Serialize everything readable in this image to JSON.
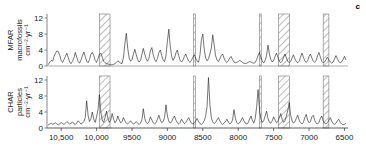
{
  "panel_label": "c",
  "xaxis_title": "Years before present",
  "chart_data": {
    "type": "line",
    "title": "",
    "subtitle": "",
    "panel_label": "c",
    "xlabel": "Years before present",
    "xlim": [
      10700,
      6450
    ],
    "x_reversed": true,
    "xticks": [
      10500,
      10000,
      9500,
      9000,
      8500,
      8000,
      7500,
      7000,
      6500
    ],
    "xticklabels": [
      "10,500",
      "10,000",
      "9500",
      "9000",
      "8500",
      "8000",
      "7500",
      "7000",
      "6500"
    ],
    "grid": false,
    "legend": "none",
    "line_color": "#1a1a1a",
    "band_color": "#555555",
    "panels": [
      {
        "name": "MFAR",
        "ylabel_line1": "MFAR",
        "ylabel_line2": "macrofossils",
        "ylabel_line3": "cm⁻²·yr⁻¹",
        "ylim": [
          0,
          13
        ],
        "yticks": [
          0,
          4,
          8,
          12
        ],
        "yticklabels": [
          "0",
          "4",
          "8",
          "12"
        ],
        "x": [
          10680,
          10660,
          10640,
          10620,
          10600,
          10580,
          10560,
          10540,
          10520,
          10500,
          10480,
          10460,
          10440,
          10420,
          10400,
          10380,
          10360,
          10340,
          10320,
          10300,
          10280,
          10260,
          10240,
          10220,
          10200,
          10180,
          10160,
          10140,
          10120,
          10100,
          10080,
          10060,
          10040,
          10020,
          10000,
          9980,
          9960,
          9940,
          9920,
          9900,
          9880,
          9860,
          9840,
          9820,
          9800,
          9780,
          9760,
          9740,
          9720,
          9700,
          9680,
          9660,
          9640,
          9620,
          9600,
          9580,
          9560,
          9540,
          9520,
          9500,
          9480,
          9460,
          9440,
          9420,
          9400,
          9380,
          9360,
          9340,
          9320,
          9300,
          9280,
          9260,
          9240,
          9220,
          9200,
          9180,
          9160,
          9140,
          9120,
          9100,
          9080,
          9060,
          9040,
          9020,
          9000,
          8980,
          8960,
          8940,
          8920,
          8900,
          8880,
          8860,
          8840,
          8820,
          8800,
          8780,
          8760,
          8740,
          8720,
          8700,
          8680,
          8660,
          8640,
          8620,
          8600,
          8580,
          8560,
          8540,
          8520,
          8500,
          8480,
          8460,
          8440,
          8420,
          8400,
          8380,
          8360,
          8340,
          8320,
          8300,
          8280,
          8260,
          8240,
          8220,
          8200,
          8180,
          8160,
          8140,
          8120,
          8100,
          8080,
          8060,
          8040,
          8020,
          8000,
          7980,
          7960,
          7940,
          7920,
          7900,
          7880,
          7860,
          7840,
          7820,
          7800,
          7780,
          7760,
          7740,
          7720,
          7700,
          7680,
          7660,
          7640,
          7620,
          7600,
          7580,
          7560,
          7540,
          7520,
          7500,
          7480,
          7460,
          7440,
          7420,
          7400,
          7380,
          7360,
          7340,
          7320,
          7300,
          7280,
          7260,
          7240,
          7220,
          7200,
          7180,
          7160,
          7140,
          7120,
          7100,
          7080,
          7060,
          7040,
          7020,
          7000,
          6980,
          6960,
          6940,
          6920,
          6900,
          6880,
          6860,
          6840,
          6820,
          6800,
          6780,
          6760,
          6740,
          6720,
          6700,
          6680,
          6660,
          6640,
          6620,
          6600,
          6580,
          6560,
          6540,
          6520,
          6500,
          6480
        ],
        "y": [
          0.4,
          1.0,
          1.4,
          1.2,
          2.4,
          3.2,
          3.8,
          3.6,
          2.6,
          1.4,
          0.9,
          1.6,
          2.4,
          3.2,
          2.1,
          1.0,
          0.6,
          1.2,
          2.0,
          3.4,
          2.2,
          1.1,
          0.7,
          1.5,
          2.6,
          3.5,
          2.4,
          1.2,
          0.8,
          1.6,
          2.9,
          3.4,
          2.6,
          1.4,
          0.9,
          1.8,
          3.0,
          3.2,
          2.2,
          1.2,
          0.8,
          0.6,
          0.5,
          0.4,
          0.3,
          0.3,
          0.4,
          0.6,
          0.9,
          1.3,
          1.0,
          0.7,
          0.6,
          2.2,
          5.6,
          8.2,
          4.4,
          2.0,
          1.2,
          1.6,
          2.9,
          4.2,
          2.8,
          1.6,
          1.0,
          1.4,
          2.8,
          4.4,
          3.0,
          1.8,
          1.2,
          2.0,
          3.8,
          4.6,
          2.8,
          1.6,
          1.1,
          1.9,
          3.4,
          4.0,
          2.6,
          1.5,
          1.1,
          2.6,
          6.2,
          9.2,
          5.0,
          2.4,
          1.4,
          2.0,
          3.2,
          4.0,
          2.6,
          1.4,
          1.0,
          1.5,
          2.4,
          3.0,
          2.0,
          1.2,
          0.9,
          1.4,
          2.2,
          2.8,
          1.9,
          1.2,
          1.0,
          2.8,
          6.6,
          8.0,
          4.2,
          2.0,
          1.3,
          1.8,
          3.0,
          4.4,
          7.8,
          5.4,
          2.6,
          1.5,
          1.1,
          1.8,
          2.6,
          3.0,
          2.0,
          1.2,
          0.9,
          1.3,
          2.0,
          2.4,
          1.6,
          1.0,
          0.8,
          0.9,
          1.1,
          1.4,
          1.2,
          0.9,
          0.7,
          0.6,
          0.7,
          0.9,
          1.1,
          1.0,
          0.8,
          0.7,
          0.9,
          1.6,
          2.6,
          3.4,
          2.2,
          1.2,
          0.8,
          1.4,
          2.6,
          5.2,
          3.0,
          1.6,
          1.0,
          1.4,
          2.4,
          3.2,
          2.2,
          1.2,
          0.8,
          1.2,
          2.2,
          3.0,
          2.0,
          1.2,
          0.8,
          1.1,
          2.0,
          2.8,
          1.8,
          1.1,
          0.8,
          1.2,
          2.2,
          3.2,
          2.2,
          1.3,
          0.9,
          1.3,
          2.4,
          3.0,
          2.0,
          1.2,
          0.9,
          1.4,
          2.6,
          3.4,
          2.2,
          1.2,
          0.8,
          1.0,
          1.6,
          2.2,
          1.5,
          1.0,
          0.7,
          1.0,
          1.8,
          2.6,
          1.8,
          1.1,
          0.8,
          1.0,
          1.6,
          2.4,
          1.6,
          1.0,
          0.7,
          0.8,
          1.2,
          1.6,
          1.1,
          0.8,
          0.6,
          0.5,
          0.5,
          0.6,
          0.7,
          0.6,
          0.5,
          0.4,
          0.4,
          0.5,
          0.5,
          0.4,
          0.4,
          0.5,
          0.6,
          0.8,
          1.0,
          0.8,
          0.6,
          0.5,
          0.6,
          0.8,
          0.9,
          0.7,
          0.5,
          0.4,
          0.5,
          0.7,
          0.9,
          0.7,
          0.5,
          0.4,
          0.5,
          0.8,
          1.0,
          0.8,
          0.6,
          0.5,
          0.6,
          0.8,
          0.7,
          0.5,
          0.4,
          0.4,
          0.5,
          0.7,
          0.8,
          0.6,
          0.5,
          0.4,
          0.5,
          0.6,
          0.8,
          0.6,
          0.5,
          0.4,
          0.5,
          0.6,
          0.7,
          0.6,
          0.5,
          0.4,
          0.5,
          0.6,
          0.7,
          0.6,
          0.5,
          0.4,
          0.5
        ]
      },
      {
        "name": "CHAR",
        "ylabel_line1": "CHAR",
        "ylabel_line2": "particles",
        "ylabel_line3": "cm⁻²·yr⁻¹",
        "ylim": [
          0,
          13
        ],
        "yticks": [
          0,
          4,
          8,
          12
        ],
        "yticklabels": [
          "0",
          "4",
          "8",
          "12"
        ],
        "x": [
          10680,
          10660,
          10640,
          10620,
          10600,
          10580,
          10560,
          10540,
          10520,
          10500,
          10480,
          10460,
          10440,
          10420,
          10400,
          10380,
          10360,
          10340,
          10320,
          10300,
          10280,
          10260,
          10240,
          10220,
          10200,
          10180,
          10160,
          10140,
          10120,
          10100,
          10080,
          10060,
          10040,
          10020,
          10000,
          9980,
          9960,
          9940,
          9920,
          9900,
          9880,
          9860,
          9840,
          9820,
          9800,
          9780,
          9760,
          9740,
          9720,
          9700,
          9680,
          9660,
          9640,
          9620,
          9600,
          9580,
          9560,
          9540,
          9520,
          9500,
          9480,
          9460,
          9440,
          9420,
          9400,
          9380,
          9360,
          9340,
          9320,
          9300,
          9280,
          9260,
          9240,
          9220,
          9200,
          9180,
          9160,
          9140,
          9120,
          9100,
          9080,
          9060,
          9040,
          9020,
          9000,
          8980,
          8960,
          8940,
          8920,
          8900,
          8880,
          8860,
          8840,
          8820,
          8800,
          8780,
          8760,
          8740,
          8720,
          8700,
          8680,
          8660,
          8640,
          8620,
          8600,
          8580,
          8560,
          8540,
          8520,
          8500,
          8480,
          8460,
          8440,
          8420,
          8400,
          8380,
          8360,
          8340,
          8320,
          8300,
          8280,
          8260,
          8240,
          8220,
          8200,
          8180,
          8160,
          8140,
          8120,
          8100,
          8080,
          8060,
          8040,
          8020,
          8000,
          7980,
          7960,
          7940,
          7920,
          7900,
          7880,
          7860,
          7840,
          7820,
          7800,
          7780,
          7760,
          7740,
          7720,
          7700,
          7680,
          7660,
          7640,
          7620,
          7600,
          7580,
          7560,
          7540,
          7520,
          7500,
          7480,
          7460,
          7440,
          7420,
          7400,
          7380,
          7360,
          7340,
          7320,
          7300,
          7280,
          7260,
          7240,
          7220,
          7200,
          7180,
          7160,
          7140,
          7120,
          7100,
          7080,
          7060,
          7040,
          7020,
          7000,
          6980,
          6960,
          6940,
          6920,
          6900,
          6880,
          6860,
          6840,
          6820,
          6800,
          6780,
          6760,
          6740,
          6720,
          6700,
          6680,
          6660,
          6640,
          6620,
          6600,
          6580,
          6560,
          6540,
          6520,
          6500,
          6480
        ],
        "y": [
          0.8,
          1.0,
          1.2,
          0.9,
          1.1,
          1.3,
          1.0,
          0.8,
          1.0,
          1.4,
          1.1,
          0.9,
          1.2,
          1.6,
          1.3,
          1.0,
          1.2,
          1.5,
          1.1,
          0.9,
          1.3,
          1.8,
          1.4,
          1.0,
          1.2,
          1.6,
          2.6,
          6.8,
          3.2,
          1.6,
          2.4,
          4.0,
          2.2,
          1.4,
          2.8,
          4.6,
          8.4,
          4.0,
          2.0,
          1.4,
          2.6,
          4.2,
          2.4,
          1.4,
          2.0,
          3.6,
          2.2,
          1.3,
          1.8,
          3.0,
          2.0,
          1.3,
          1.6,
          2.6,
          1.8,
          1.2,
          1.0,
          1.4,
          1.8,
          1.3,
          1.0,
          1.2,
          1.6,
          1.2,
          0.9,
          1.2,
          2.0,
          4.8,
          2.4,
          1.4,
          1.1,
          1.6,
          2.8,
          2.0,
          1.3,
          1.0,
          1.4,
          2.2,
          3.2,
          2.0,
          1.3,
          1.6,
          2.6,
          5.8,
          3.0,
          1.7,
          1.2,
          1.6,
          2.4,
          3.0,
          2.0,
          1.3,
          1.0,
          1.4,
          2.2,
          1.6,
          1.1,
          1.4,
          2.0,
          2.6,
          1.8,
          1.2,
          1.0,
          1.3,
          1.8,
          2.4,
          1.6,
          1.1,
          0.9,
          1.2,
          1.8,
          3.0,
          5.4,
          12.6,
          6.0,
          2.6,
          1.5,
          1.1,
          1.4,
          2.0,
          2.6,
          1.8,
          1.2,
          0.9,
          1.2,
          1.6,
          2.2,
          1.5,
          1.0,
          1.3,
          2.0,
          4.6,
          2.4,
          1.4,
          1.0,
          1.3,
          1.9,
          2.6,
          1.8,
          1.2,
          1.0,
          1.3,
          2.2,
          3.0,
          1.9,
          1.2,
          2.4,
          5.2,
          9.6,
          4.6,
          2.2,
          1.4,
          1.8,
          3.0,
          4.2,
          2.4,
          1.4,
          1.2,
          1.8,
          2.8,
          2.0,
          1.3,
          1.6,
          2.6,
          3.6,
          2.2,
          1.4,
          1.8,
          3.0,
          4.4,
          6.4,
          3.2,
          1.8,
          1.2,
          1.6,
          2.4,
          3.2,
          2.0,
          1.3,
          1.0,
          1.4,
          2.6,
          3.4,
          2.0,
          1.3,
          1.6,
          2.8,
          3.2,
          1.9,
          1.2,
          1.0,
          1.4,
          2.4,
          3.0,
          1.8,
          1.2,
          1.0,
          1.3,
          2.0,
          2.6,
          1.7,
          1.1,
          0.9,
          1.2,
          1.8,
          2.2,
          1.4,
          1.0,
          0.8,
          0.9,
          1.2,
          1.4,
          1.0,
          0.8,
          0.9,
          1.4,
          2.0,
          3.4,
          2.0,
          1.2,
          0.9,
          1.2,
          2.0,
          2.8,
          1.8,
          1.1,
          1.4,
          2.2,
          3.0,
          1.9,
          1.2,
          1.5,
          2.4,
          3.1,
          1.9,
          1.2,
          1.0,
          1.6,
          2.6,
          1.8,
          1.2,
          1.6,
          2.4,
          1.6,
          1.1,
          1.4,
          2.0,
          1.4,
          1.0,
          1.3,
          1.8,
          1.3,
          1.0,
          1.2,
          1.6,
          1.2,
          0.9,
          1.1,
          1.5,
          1.1,
          0.9
        ]
      }
    ],
    "hatched_bands": [
      {
        "name": "band-1",
        "start": 9960,
        "end": 9810
      },
      {
        "name": "band-2",
        "start": 8630,
        "end": 8605
      },
      {
        "name": "band-3",
        "start": 7700,
        "end": 7675
      },
      {
        "name": "band-4",
        "start": 7430,
        "end": 7275
      },
      {
        "name": "band-5",
        "start": 6800,
        "end": 6720
      }
    ]
  }
}
